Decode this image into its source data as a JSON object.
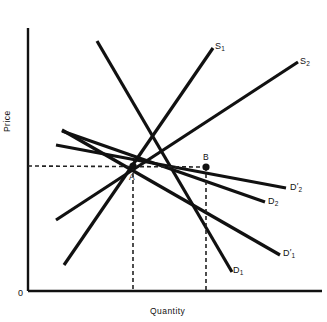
{
  "chart_data": {
    "type": "line",
    "title": "",
    "xlabel": "Quantity",
    "ylabel": "Price",
    "origin_label": "0",
    "grid": false,
    "legend": "inline-end-labels",
    "xlim": [
      0,
      100
    ],
    "ylim": [
      0,
      100
    ],
    "axis_style": "two-axis open (left spine + bottom spine), no tick numbers",
    "equilibrium_points": [
      {
        "name": "A",
        "x_px": 133,
        "y_px": 166,
        "label": "A",
        "note": "intersection of S1 with D1 and D2 at initial quantity"
      },
      {
        "name": "B",
        "x_px": 206,
        "y_px": 167,
        "label": "B",
        "note": "intersection of S2 with shifted demand at larger quantity, same price"
      }
    ],
    "price_line": {
      "style": "dashed",
      "from_px": [
        28,
        166
      ],
      "to_px": [
        206,
        167
      ],
      "note": "common equilibrium price level"
    },
    "quantity_drops": [
      {
        "from_px": [
          133,
          166
        ],
        "to_px": [
          133,
          291
        ],
        "style": "dashed"
      },
      {
        "from_px": [
          206,
          167
        ],
        "to_px": [
          206,
          291
        ],
        "style": "dashed"
      }
    ],
    "series": [
      {
        "name": "S1",
        "label": "S",
        "sub": "1",
        "prime": false,
        "kind": "supply",
        "from_px": [
          64,
          265
        ],
        "to_px": [
          213,
          48
        ],
        "color": "#111111",
        "width_px": 3.2
      },
      {
        "name": "S2",
        "label": "S",
        "sub": "2",
        "prime": false,
        "kind": "supply",
        "from_px": [
          56,
          220
        ],
        "to_px": [
          298,
          62
        ],
        "color": "#111111",
        "width_px": 3.2
      },
      {
        "name": "D1",
        "label": "D",
        "sub": "1",
        "prime": false,
        "kind": "demand",
        "from_px": [
          97,
          41
        ],
        "to_px": [
          232,
          272
        ],
        "color": "#111111",
        "width_px": 3.2
      },
      {
        "name": "D1prime",
        "label": "D",
        "sub": "1",
        "prime": true,
        "kind": "demand",
        "from_px": [
          62,
          130
        ],
        "to_px": [
          280,
          255
        ],
        "color": "#111111",
        "width_px": 3.2
      },
      {
        "name": "D2",
        "label": "D",
        "sub": "2",
        "prime": false,
        "kind": "demand",
        "from_px": [
          62,
          131
        ],
        "to_px": [
          265,
          202
        ],
        "color": "#111111",
        "width_px": 3.2
      },
      {
        "name": "D2prime",
        "label": "D",
        "sub": "2",
        "prime": true,
        "kind": "demand",
        "from_px": [
          56,
          145
        ],
        "to_px": [
          286,
          188
        ],
        "color": "#111111",
        "width_px": 3.2
      }
    ]
  },
  "axes": {
    "y_title": "Price",
    "x_title": "Quantity",
    "origin": "0",
    "axis_color": "#111111"
  },
  "labels": {
    "s1": {
      "base": "S",
      "sub": "1",
      "prime": ""
    },
    "s2": {
      "base": "S",
      "sub": "2",
      "prime": ""
    },
    "d1": {
      "base": "D",
      "sub": "1",
      "prime": ""
    },
    "d1p": {
      "base": "D",
      "sub": "1",
      "prime": "′"
    },
    "d2": {
      "base": "D",
      "sub": "2",
      "prime": ""
    },
    "d2p": {
      "base": "D",
      "sub": "2",
      "prime": "′"
    },
    "point_a": "A",
    "point_b": "B"
  },
  "colors": {
    "ink": "#111111",
    "background": "#ffffff",
    "dash": "#222222"
  }
}
